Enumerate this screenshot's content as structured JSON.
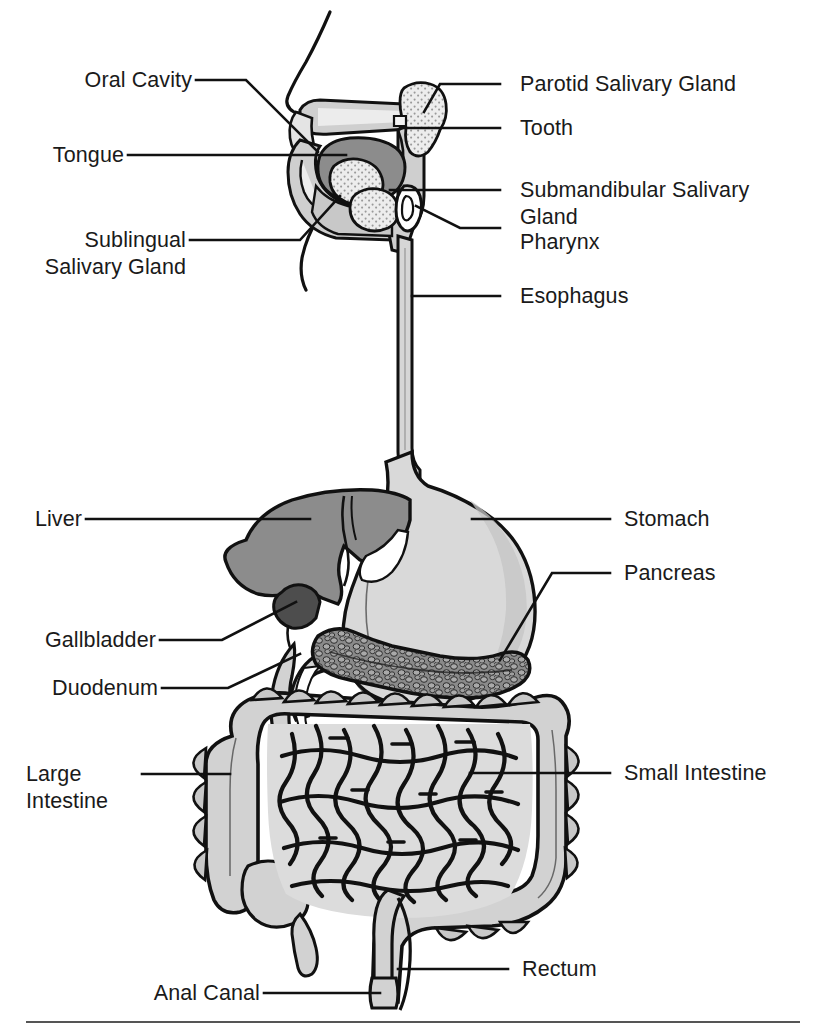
{
  "figure": {
    "type": "anatomical-diagram",
    "view": "sagittal head with abdominal organs",
    "background_color": "#ffffff",
    "outline_color": "#111111",
    "palette": {
      "stomach_fill": "#d9d9d9",
      "liver_fill": "#8c8c8c",
      "liver_dark_fill": "#4d4d4d",
      "pancreas_fill": "#8f8f8f",
      "intestine_fill": "#d2d2d2",
      "intestine_shade": "#bdbdbd",
      "tongue_fill": "#8c8c8c",
      "head_fill": "#cfcfcf",
      "head_light_fill": "#e8e8e8",
      "gland_fill": "#e0e0e0"
    },
    "rule_color": "#555555"
  },
  "labels_left": [
    {
      "id": "oral-cavity",
      "text": "Oral Cavity"
    },
    {
      "id": "tongue",
      "text": "Tongue"
    },
    {
      "id": "sublingual",
      "text": "Sublingual\nSalivary Gland"
    },
    {
      "id": "liver",
      "text": "Liver"
    },
    {
      "id": "gallbladder",
      "text": "Gallbladder"
    },
    {
      "id": "duodenum",
      "text": "Duodenum"
    },
    {
      "id": "large-intestine",
      "text": "Large\nIntestine"
    },
    {
      "id": "anal-canal",
      "text": "Anal Canal"
    }
  ],
  "labels_right": [
    {
      "id": "parotid",
      "text": "Parotid Salivary Gland"
    },
    {
      "id": "tooth",
      "text": "Tooth"
    },
    {
      "id": "submandibular",
      "text": "Submandibular Salivary\nGland"
    },
    {
      "id": "pharynx",
      "text": "Pharynx"
    },
    {
      "id": "esophagus",
      "text": "Esophagus"
    },
    {
      "id": "stomach",
      "text": "Stomach"
    },
    {
      "id": "pancreas",
      "text": "Pancreas"
    },
    {
      "id": "small-intestine",
      "text": "Small Intestine"
    },
    {
      "id": "rectum",
      "text": "Rectum"
    }
  ],
  "organs": [
    "Oral Cavity",
    "Tongue",
    "Sublingual Salivary Gland",
    "Parotid Salivary Gland",
    "Tooth",
    "Submandibular Salivary Gland",
    "Pharynx",
    "Esophagus",
    "Stomach",
    "Liver",
    "Gallbladder",
    "Pancreas",
    "Duodenum",
    "Small Intestine",
    "Large Intestine",
    "Rectum",
    "Anal Canal"
  ]
}
